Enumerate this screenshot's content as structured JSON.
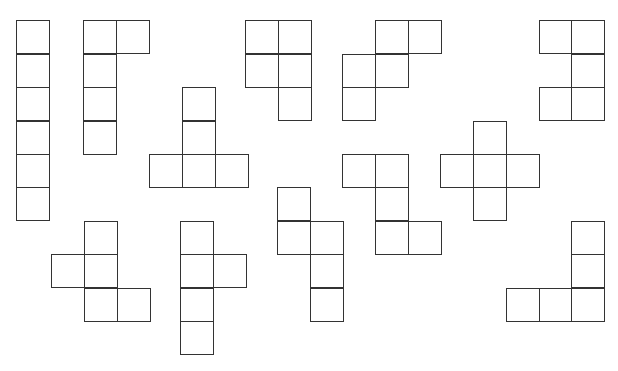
{
  "diagram": {
    "title": "",
    "cell_size": 33.3,
    "stroke_color": "#333333",
    "shapes": [
      {
        "name": "hexomino-1",
        "cells": [
          [
            16,
            20
          ],
          [
            16,
            54
          ],
          [
            16,
            87
          ],
          [
            16,
            121
          ],
          [
            16,
            154
          ],
          [
            16,
            187
          ]
        ]
      },
      {
        "name": "hexomino-2",
        "cells": [
          [
            83,
            20
          ],
          [
            116,
            20
          ],
          [
            83,
            54
          ],
          [
            83,
            87
          ],
          [
            83,
            121
          ]
        ]
      },
      {
        "name": "hexomino-3",
        "cells": [
          [
            182,
            87
          ],
          [
            182,
            121
          ],
          [
            149,
            154
          ],
          [
            182,
            154
          ],
          [
            215,
            154
          ]
        ]
      },
      {
        "name": "hexomino-4",
        "cells": [
          [
            245,
            20
          ],
          [
            278,
            20
          ],
          [
            245,
            54
          ],
          [
            278,
            54
          ],
          [
            278,
            87
          ]
        ]
      },
      {
        "name": "hexomino-5",
        "cells": [
          [
            375,
            20
          ],
          [
            408,
            20
          ],
          [
            342,
            54
          ],
          [
            375,
            54
          ],
          [
            342,
            87
          ]
        ]
      },
      {
        "name": "hexomino-6",
        "cells": [
          [
            539,
            20
          ],
          [
            571,
            20
          ],
          [
            571,
            54
          ],
          [
            539,
            87
          ],
          [
            571,
            87
          ]
        ]
      },
      {
        "name": "hexomino-7",
        "cells": [
          [
            342,
            154
          ],
          [
            375,
            154
          ],
          [
            375,
            187
          ],
          [
            375,
            221
          ],
          [
            408,
            221
          ]
        ]
      },
      {
        "name": "hexomino-8",
        "cells": [
          [
            473,
            121
          ],
          [
            440,
            154
          ],
          [
            473,
            154
          ],
          [
            506,
            154
          ],
          [
            473,
            187
          ]
        ]
      },
      {
        "name": "hexomino-9",
        "cells": [
          [
            84,
            221
          ],
          [
            51,
            254
          ],
          [
            84,
            254
          ],
          [
            84,
            288
          ],
          [
            117,
            288
          ]
        ]
      },
      {
        "name": "hexomino-10",
        "cells": [
          [
            180,
            221
          ],
          [
            180,
            254
          ],
          [
            213,
            254
          ],
          [
            180,
            288
          ],
          [
            180,
            321
          ]
        ]
      },
      {
        "name": "hexomino-11",
        "cells": [
          [
            277,
            187
          ],
          [
            277,
            221
          ],
          [
            310,
            221
          ],
          [
            310,
            254
          ],
          [
            310,
            288
          ]
        ]
      },
      {
        "name": "hexomino-12",
        "cells": [
          [
            571,
            221
          ],
          [
            571,
            254
          ],
          [
            506,
            288
          ],
          [
            539,
            288
          ],
          [
            571,
            288
          ]
        ]
      }
    ]
  }
}
